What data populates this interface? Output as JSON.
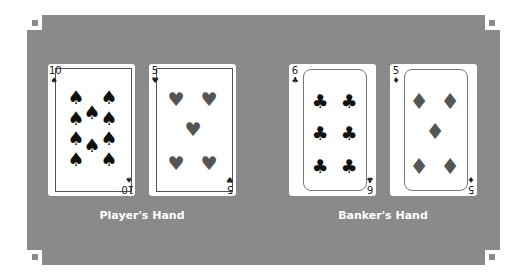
{
  "colors": {
    "table": "#8a8a8a",
    "card": "#ffffff",
    "label": "#ffffff"
  },
  "hands": [
    {
      "label": "Player's Hand",
      "cards": [
        {
          "rank": "10",
          "suit": "spades",
          "symbol": "♠",
          "pips": 10
        },
        {
          "rank": "5",
          "suit": "hearts",
          "symbol": "♥",
          "pips": 5
        }
      ]
    },
    {
      "label": "Banker's Hand",
      "cards": [
        {
          "rank": "6",
          "suit": "clubs",
          "symbol": "♣",
          "pips": 6
        },
        {
          "rank": "5",
          "suit": "diamonds",
          "symbol": "♦",
          "pips": 5
        }
      ]
    }
  ]
}
